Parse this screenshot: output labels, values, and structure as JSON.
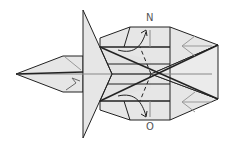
{
  "diagram": {
    "type": "origami-fold-diagram",
    "labels": {
      "top": "N",
      "bottom": "O"
    },
    "colors": {
      "paper": "#e6e6e6",
      "edge": "#222222",
      "crease": "#8a8a8a",
      "background": "#ffffff"
    }
  }
}
